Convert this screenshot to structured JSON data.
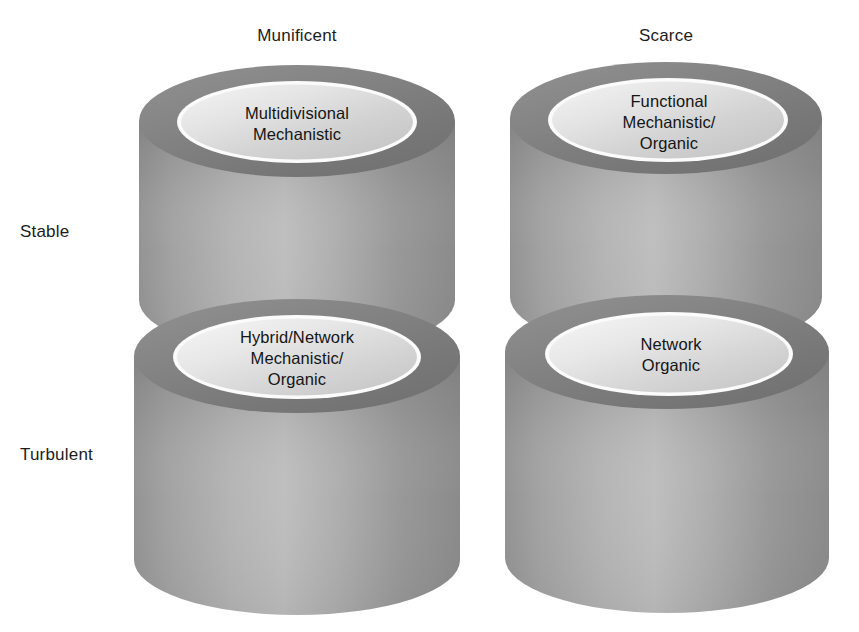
{
  "figure": {
    "background_color": "#ffffff",
    "text_color": "#1a1a1a",
    "column_headers": [
      {
        "id": "munificent",
        "label": "Munificent"
      },
      {
        "id": "scarce",
        "label": "Scarce"
      }
    ],
    "row_labels": [
      {
        "id": "stable",
        "label": "Stable"
      },
      {
        "id": "turbulent",
        "label": "Turbulent"
      }
    ],
    "cylinders": [
      {
        "id": "stable-munificent",
        "row": "Stable",
        "column": "Munificent",
        "label": "Multidivisional\nMechanistic",
        "lines": [
          "Multidivisional",
          "Mechanistic"
        ]
      },
      {
        "id": "stable-scarce",
        "row": "Stable",
        "column": "Scarce",
        "label": "Functional\nMechanistic/\nOrganic",
        "lines": [
          "Functional",
          "Mechanistic/",
          "Organic"
        ]
      },
      {
        "id": "turbulent-munificent",
        "row": "Turbulent",
        "column": "Munificent",
        "label": "Hybrid/Network\nMechanistic/\nOrganic",
        "lines": [
          "Hybrid/Network",
          "Mechanistic/",
          "Organic"
        ]
      },
      {
        "id": "turbulent-scarce",
        "row": "Turbulent",
        "column": "Scarce",
        "label": "Network\nOrganic",
        "lines": [
          "Network",
          "Organic"
        ]
      }
    ],
    "palette": {
      "rim_dark": "#7d7d7d",
      "rim_darker": "#6e6e6e",
      "body_light": "#a9a9a9",
      "body_mid": "#9b9b9b",
      "body_dark": "#8a8a8a",
      "inner_light": "#d7d7d7",
      "inner_pale": "#ededed",
      "ring_white": "#fdfdfd"
    }
  }
}
